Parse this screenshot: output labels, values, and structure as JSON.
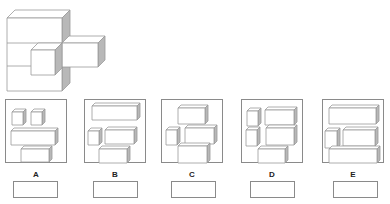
{
  "question": {
    "figure": {
      "name": "3d-cube-assembly",
      "blocks": [
        {
          "id": "main-block",
          "x": 7,
          "y": 18,
          "w": 55,
          "h": 73,
          "d": 8,
          "dividers": [
            43,
            66
          ]
        },
        {
          "id": "right-bar",
          "x": 62,
          "y": 43,
          "w": 36,
          "h": 24,
          "d": 7
        },
        {
          "id": "front-cube",
          "x": 31,
          "y": 50,
          "w": 24,
          "h": 25,
          "d": 7
        }
      ]
    },
    "style": {
      "stroke": "#9a9a9a",
      "face": "#ffffff",
      "side": "#b8b8b8"
    }
  },
  "options": [
    {
      "label": "A",
      "answer": "",
      "pieces": [
        {
          "x": 6,
          "y": 12,
          "w": 11,
          "h": 13,
          "d": 3
        },
        {
          "x": 25,
          "y": 12,
          "w": 11,
          "h": 13,
          "d": 3
        },
        {
          "x": 5,
          "y": 31,
          "w": 44,
          "h": 14,
          "d": 3
        },
        {
          "x": 15,
          "y": 49,
          "w": 28,
          "h": 13,
          "d": 3
        }
      ]
    },
    {
      "label": "B",
      "answer": "",
      "pieces": [
        {
          "x": 7,
          "y": 6,
          "w": 45,
          "h": 14,
          "d": 3
        },
        {
          "x": 3,
          "y": 31,
          "w": 11,
          "h": 14,
          "d": 3
        },
        {
          "x": 20,
          "y": 30,
          "w": 29,
          "h": 14,
          "d": 3
        },
        {
          "x": 14,
          "y": 49,
          "w": 28,
          "h": 14,
          "d": 3
        }
      ]
    },
    {
      "label": "C",
      "answer": "",
      "pieces": [
        {
          "x": 16,
          "y": 8,
          "w": 27,
          "h": 16,
          "d": 3
        },
        {
          "x": 4,
          "y": 30,
          "w": 11,
          "h": 15,
          "d": 3
        },
        {
          "x": 23,
          "y": 28,
          "w": 29,
          "h": 16,
          "d": 3
        },
        {
          "x": 16,
          "y": 46,
          "w": 29,
          "h": 17,
          "d": 3
        }
      ]
    },
    {
      "label": "D",
      "answer": "",
      "pieces": [
        {
          "x": 5,
          "y": 11,
          "w": 11,
          "h": 15,
          "d": 3
        },
        {
          "x": 23,
          "y": 10,
          "w": 29,
          "h": 15,
          "d": 3
        },
        {
          "x": 4,
          "y": 30,
          "w": 11,
          "h": 16,
          "d": 3
        },
        {
          "x": 24,
          "y": 28,
          "w": 28,
          "h": 17,
          "d": 3
        },
        {
          "x": 16,
          "y": 49,
          "w": 27,
          "h": 14,
          "d": 3
        }
      ]
    },
    {
      "label": "E",
      "answer": "",
      "pieces": [
        {
          "x": 6,
          "y": 8,
          "w": 47,
          "h": 16,
          "d": 3
        },
        {
          "x": 2,
          "y": 31,
          "w": 12,
          "h": 17,
          "d": 3
        },
        {
          "x": 20,
          "y": 30,
          "w": 32,
          "h": 16,
          "d": 3
        },
        {
          "x": 6,
          "y": 49,
          "w": 48,
          "h": 14,
          "d": 3
        }
      ]
    }
  ],
  "layout": {
    "panels_x": [
      5,
      84,
      161,
      241,
      322
    ],
    "panels_y": 99,
    "boxes_x": [
      13,
      93,
      171,
      250,
      333
    ]
  }
}
